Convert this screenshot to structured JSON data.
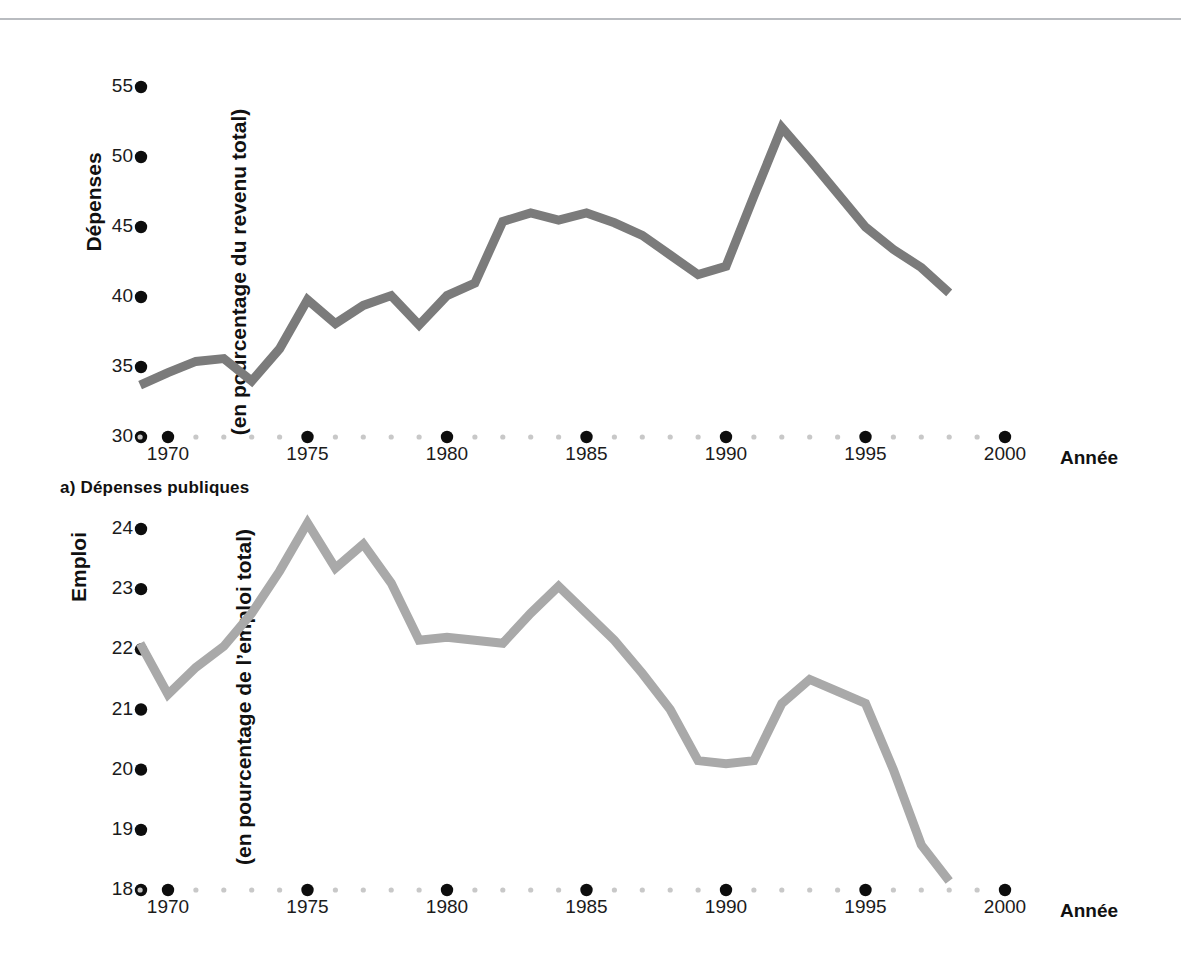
{
  "page": {
    "background": "#ffffff",
    "rule_color": "#b9bcc0"
  },
  "chart_data": [
    {
      "id": "a",
      "type": "line",
      "title": "",
      "caption": "a) Dépenses publiques",
      "ylabel_line1": "Dépenses",
      "ylabel_line2": "(en pourcentage du revenu total)",
      "xlabel": "Année",
      "grid": false,
      "legend": "none",
      "line_color": "#7b7b7b",
      "line_width": 9,
      "ylim": [
        30,
        55
      ],
      "yticks": [
        30,
        35,
        40,
        45,
        50,
        55
      ],
      "ytick_labels": [
        "30",
        "35",
        "40",
        "45",
        "50",
        "55"
      ],
      "xlim": [
        1969,
        2000
      ],
      "xticks": [
        1970,
        1975,
        1980,
        1985,
        1990,
        1995,
        2000
      ],
      "xtick_labels": [
        "1970",
        "1975",
        "1980",
        "1985",
        "1990",
        "1995",
        "2000"
      ],
      "x": [
        1969,
        1970,
        1971,
        1972,
        1973,
        1974,
        1975,
        1976,
        1977,
        1978,
        1979,
        1980,
        1981,
        1982,
        1983,
        1984,
        1985,
        1986,
        1987,
        1988,
        1989,
        1990,
        1991,
        1992,
        1993,
        1994,
        1995,
        1996,
        1997,
        1998
      ],
      "values": [
        33.7,
        34.6,
        35.4,
        35.6,
        34.0,
        36.3,
        39.8,
        38.1,
        39.4,
        40.1,
        38.0,
        40.1,
        41.0,
        45.4,
        46.0,
        45.5,
        46.0,
        45.3,
        44.4,
        43.0,
        41.6,
        42.2,
        47.2,
        52.1,
        49.8,
        47.4,
        45.0,
        43.4,
        42.1,
        40.3
      ]
    },
    {
      "id": "b",
      "type": "line",
      "title": "",
      "caption": "",
      "ylabel_line1": "Emploi",
      "ylabel_line2": "(en pourcentage de l’emploi total)",
      "xlabel": "Année",
      "grid": false,
      "legend": "none",
      "line_color": "#a9a9a9",
      "line_width": 9,
      "ylim": [
        18,
        24.4
      ],
      "yticks": [
        18,
        19,
        20,
        21,
        22,
        23,
        24
      ],
      "ytick_labels": [
        "18",
        "19",
        "20",
        "21",
        "22",
        "23",
        "24"
      ],
      "xlim": [
        1969,
        2000
      ],
      "xticks": [
        1970,
        1975,
        1980,
        1985,
        1990,
        1995,
        2000
      ],
      "xtick_labels": [
        "1970",
        "1975",
        "1980",
        "1985",
        "1990",
        "1995",
        "2000"
      ],
      "x": [
        1969,
        1970,
        1971,
        1972,
        1973,
        1974,
        1975,
        1976,
        1977,
        1978,
        1979,
        1980,
        1981,
        1982,
        1983,
        1984,
        1985,
        1986,
        1987,
        1988,
        1989,
        1990,
        1991,
        1992,
        1993,
        1994,
        1995,
        1996,
        1997,
        1998
      ],
      "values": [
        22.1,
        21.25,
        21.7,
        22.05,
        22.6,
        23.3,
        24.1,
        23.35,
        23.75,
        23.1,
        22.15,
        22.2,
        22.15,
        22.1,
        22.6,
        23.05,
        22.6,
        22.15,
        21.6,
        21.0,
        20.15,
        20.1,
        20.15,
        21.1,
        21.5,
        21.3,
        21.1,
        20.0,
        18.75,
        18.15
      ]
    }
  ]
}
